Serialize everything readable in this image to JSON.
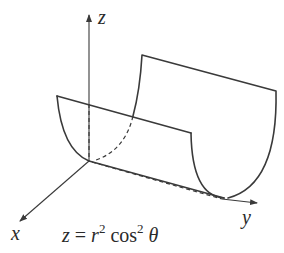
{
  "figure": {
    "axes": {
      "z_label": "z",
      "y_label": "y",
      "x_label": "x"
    },
    "equation": {
      "z": "z",
      "equals": " = ",
      "r": "r",
      "r_exp": "2",
      "cos": " cos",
      "cos_exp": "2",
      "theta": " θ"
    },
    "stroke_color": "#3a3a3a"
  }
}
